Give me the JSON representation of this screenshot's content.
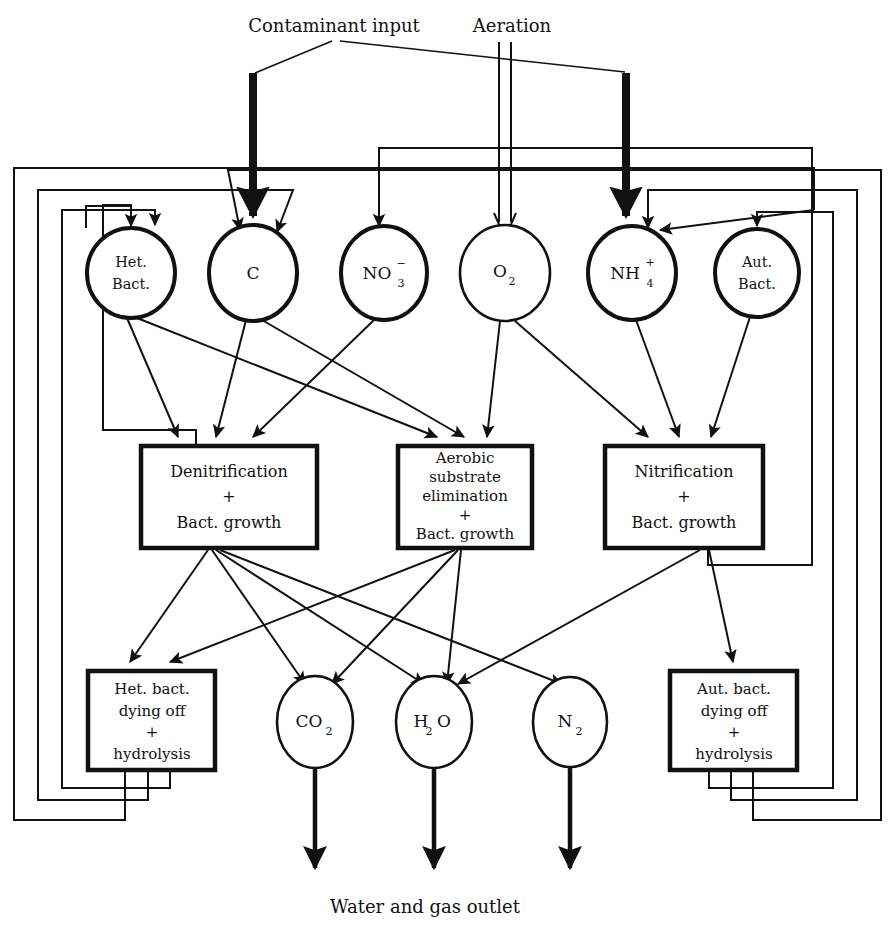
{
  "figure": {
    "background_color": "#ffffff",
    "ink_color": "#111111"
  },
  "free_labels": {
    "contaminant_input": "Contaminant input",
    "aeration": "Aeration",
    "outlet": "Water and gas outlet"
  },
  "state_nodes": [
    {
      "id": "het_bact",
      "label_line1": "Het.",
      "label_line2": "Bact.",
      "shape": "ellipse",
      "cx": 131,
      "cy": 273
    },
    {
      "id": "c",
      "label_line1": "C",
      "label_line2": "",
      "shape": "ellipse",
      "cx": 253,
      "cy": 273
    },
    {
      "id": "no3",
      "label_line1": "NO",
      "label_line2": "",
      "sub": "3",
      "sup": "−",
      "shape": "ellipse",
      "cx": 384,
      "cy": 273
    },
    {
      "id": "o2",
      "label_line1": "O",
      "label_line2": "",
      "sub": "2",
      "shape": "ellipse",
      "cx": 505,
      "cy": 273
    },
    {
      "id": "nh4",
      "label_line1": "NH",
      "label_line2": "",
      "sub": "4",
      "sup": "+",
      "shape": "ellipse",
      "cx": 632,
      "cy": 273
    },
    {
      "id": "aut_bact",
      "label_line1": "Aut.",
      "label_line2": "Bact.",
      "shape": "ellipse",
      "cx": 757,
      "cy": 273
    }
  ],
  "process_boxes": [
    {
      "id": "denitrification",
      "lines": [
        "Denitrification",
        "+",
        "Bact. growth"
      ],
      "x": 141,
      "y": 446,
      "w": 176,
      "h": 102
    },
    {
      "id": "aerobic",
      "lines": [
        "Aerobic",
        "substrate",
        "elimination",
        "+",
        "Bact. growth"
      ],
      "x": 398,
      "y": 446,
      "w": 134,
      "h": 102
    },
    {
      "id": "nitrification",
      "lines": [
        "Nitrification",
        "+",
        "Bact. growth"
      ],
      "x": 605,
      "y": 446,
      "w": 158,
      "h": 102
    }
  ],
  "sink_boxes": [
    {
      "id": "het_dying",
      "lines": [
        "Het. bact.",
        "dying off",
        "+",
        "hydrolysis"
      ],
      "x": 88,
      "y": 671,
      "w": 127,
      "h": 99
    },
    {
      "id": "aut_dying",
      "lines": [
        "Aut. bact.",
        "dying off",
        "+",
        "hydrolysis"
      ],
      "x": 670,
      "y": 671,
      "w": 127,
      "h": 99
    }
  ],
  "product_nodes": [
    {
      "id": "co2",
      "label": "CO",
      "sub": "2",
      "cx": 315,
      "cy": 722
    },
    {
      "id": "h2o",
      "label": "H",
      "sub_pre": "2",
      "label_post": "O",
      "cx": 434,
      "cy": 722
    },
    {
      "id": "n2",
      "label": "N",
      "sub": "2",
      "cx": 570,
      "cy": 722
    }
  ],
  "edges": {
    "inputs": [
      {
        "from": "contaminant_input",
        "to": "c",
        "style": "thick"
      },
      {
        "from": "contaminant_input",
        "to": "nh4",
        "style": "thick"
      },
      {
        "from": "aeration",
        "to": "o2",
        "style": "double-line"
      }
    ],
    "state_to_process": [
      {
        "from": "het_bact",
        "to": "denitrification"
      },
      {
        "from": "het_bact",
        "to": "aerobic"
      },
      {
        "from": "c",
        "to": "denitrification"
      },
      {
        "from": "c",
        "to": "aerobic"
      },
      {
        "from": "no3",
        "to": "denitrification"
      },
      {
        "from": "o2",
        "to": "aerobic"
      },
      {
        "from": "o2",
        "to": "nitrification"
      },
      {
        "from": "nh4",
        "to": "nitrification"
      },
      {
        "from": "aut_bact",
        "to": "nitrification"
      }
    ],
    "process_to_product": [
      {
        "from": "denitrification",
        "to": "het_dying"
      },
      {
        "from": "denitrification",
        "to": "co2"
      },
      {
        "from": "denitrification",
        "to": "h2o"
      },
      {
        "from": "denitrification",
        "to": "n2"
      },
      {
        "from": "aerobic",
        "to": "het_dying"
      },
      {
        "from": "aerobic",
        "to": "co2"
      },
      {
        "from": "aerobic",
        "to": "h2o"
      },
      {
        "from": "nitrification",
        "to": "h2o"
      },
      {
        "from": "nitrification",
        "to": "aut_dying"
      }
    ],
    "feedback_loops": [
      {
        "from": "denitrification",
        "to": "het_bact",
        "side": "left"
      },
      {
        "from": "het_dying",
        "to": "het_bact",
        "side": "left"
      },
      {
        "from": "het_dying",
        "to": "c",
        "side": "left"
      },
      {
        "from": "het_dying",
        "to": "nh4",
        "side": "left"
      },
      {
        "from": "nitrification",
        "to": "no3",
        "side": "right"
      },
      {
        "from": "aut_dying",
        "to": "aut_bact",
        "side": "right"
      },
      {
        "from": "aut_dying",
        "to": "c",
        "side": "right"
      },
      {
        "from": "aut_dying",
        "to": "nh4",
        "side": "right"
      }
    ],
    "outlets": [
      {
        "from": "co2",
        "to": "outlet"
      },
      {
        "from": "h2o",
        "to": "outlet"
      },
      {
        "from": "n2",
        "to": "outlet"
      }
    ]
  }
}
